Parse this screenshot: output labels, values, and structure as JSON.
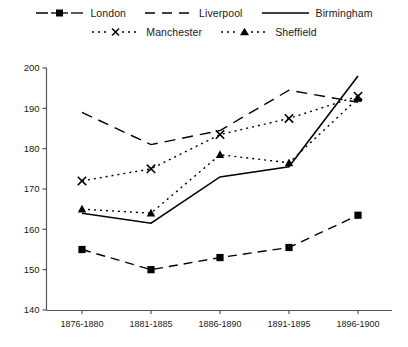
{
  "chart_data": {
    "type": "line",
    "title": "",
    "subtitle": "",
    "xlabel": "",
    "ylabel": "",
    "categories": [
      "1876-1880",
      "1881-1885",
      "1886-1890",
      "1891-1895",
      "1896-1900"
    ],
    "ylim": [
      140,
      200
    ],
    "yticks": [
      140,
      150,
      160,
      170,
      180,
      190,
      200
    ],
    "grid": false,
    "legend_position": "top",
    "series": [
      {
        "name": "London",
        "marker": "filled-square",
        "line_style": "dashed",
        "color": "#000000",
        "values": [
          155.0,
          150.0,
          153.0,
          155.5,
          163.5
        ]
      },
      {
        "name": "Liverpool",
        "marker": "none",
        "line_style": "long-dashed",
        "color": "#000000",
        "values": [
          189.0,
          181.0,
          184.5,
          194.5,
          191.5
        ]
      },
      {
        "name": "Birmingham",
        "marker": "none",
        "line_style": "solid",
        "color": "#000000",
        "values": [
          164.0,
          161.5,
          173.0,
          175.5,
          198.0
        ]
      },
      {
        "name": "Manchester",
        "marker": "cross-x",
        "line_style": "dotted",
        "color": "#000000",
        "values": [
          172.0,
          175.0,
          183.5,
          187.5,
          193.0
        ]
      },
      {
        "name": "Sheffield",
        "marker": "filled-triangle",
        "line_style": "dotted",
        "color": "#000000",
        "values": [
          165.0,
          164.0,
          178.5,
          176.5,
          192.5
        ]
      }
    ]
  },
  "legend": {
    "row1": [
      "London",
      "Liverpool",
      "Birmingham"
    ],
    "row2": [
      "Manchester",
      "Sheffield"
    ]
  },
  "axis": {
    "y_tick_labels": [
      "200",
      "190",
      "180",
      "170",
      "160",
      "150",
      "140"
    ],
    "x_tick_labels": [
      "1876-1880",
      "1881-1885",
      "1886-1890",
      "1891-1895",
      "1896-1900"
    ]
  },
  "colors": {
    "ink": "#000000",
    "axis": "#4d4d4d",
    "background": "#ffffff"
  }
}
